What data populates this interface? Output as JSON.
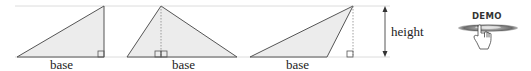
{
  "diagram": {
    "labels": {
      "base": [
        "base",
        "base",
        "base"
      ],
      "height": "height"
    },
    "triangles": [
      {
        "name": "right-triangle",
        "points": [
          [
            17,
            57
          ],
          [
            104,
            6
          ],
          [
            104,
            57
          ]
        ],
        "altitude_x": 104,
        "right_angle_at": [
          104,
          57
        ]
      },
      {
        "name": "acute-triangle",
        "points": [
          [
            127,
            57
          ],
          [
            161,
            6
          ],
          [
            237,
            57
          ]
        ],
        "altitude_x": 161,
        "right_angle_at": [
          161,
          57
        ]
      },
      {
        "name": "obtuse-triangle",
        "points": [
          [
            250,
            57
          ],
          [
            353,
            6
          ],
          [
            327,
            57
          ]
        ],
        "altitude_x": 353,
        "right_angle_at": [
          353,
          57
        ]
      }
    ],
    "guides": {
      "top_y": 6,
      "baseline_y": 57
    },
    "colors": {
      "fill": "#ececec",
      "stroke": "#555555",
      "guide": "#d9d9d9",
      "dotted": "#888888"
    }
  },
  "demo_button": {
    "label": "DEMO",
    "icon": "pointing-hand-icon"
  }
}
